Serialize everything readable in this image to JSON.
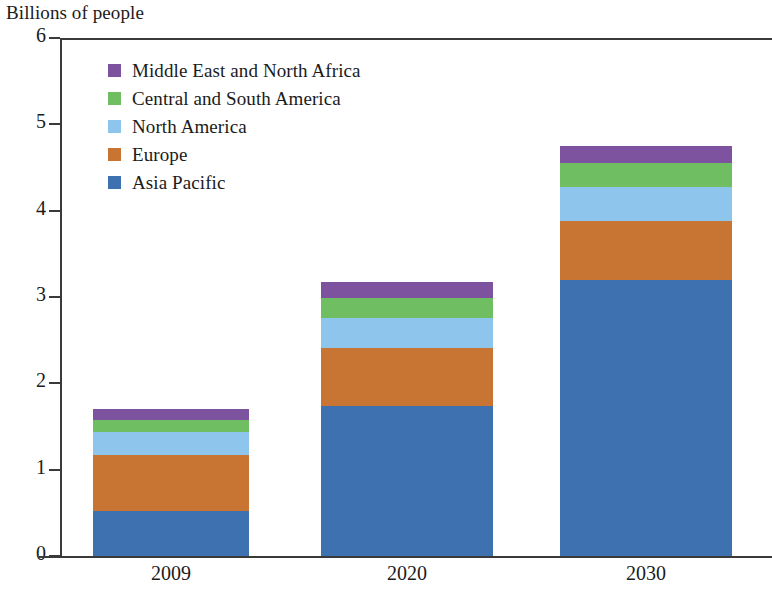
{
  "chart_data": {
    "type": "bar",
    "stacked": true,
    "title": "",
    "ylabel": "Billions of people",
    "xlabel": "",
    "categories": [
      "2009",
      "2020",
      "2030"
    ],
    "ylim": [
      0,
      6
    ],
    "yticks": [
      "0",
      "1",
      "2",
      "3",
      "4",
      "5",
      "6"
    ],
    "grid": false,
    "legend_position": "inside-upper-left",
    "series": [
      {
        "name": "Middle East and North Africa",
        "color": "#7D529E",
        "values": [
          0.12,
          0.18,
          0.2
        ]
      },
      {
        "name": "Central and South America",
        "color": "#6FBE61",
        "values": [
          0.14,
          0.23,
          0.27
        ]
      },
      {
        "name": "North America",
        "color": "#8EC5EC",
        "values": [
          0.27,
          0.35,
          0.4
        ]
      },
      {
        "name": "Europe",
        "color": "#C87533",
        "values": [
          0.65,
          0.67,
          0.68
        ]
      },
      {
        "name": "Asia Pacific",
        "color": "#3E71B0",
        "values": [
          0.52,
          1.74,
          3.2
        ]
      }
    ],
    "totals": [
      1.82,
      3.17,
      4.75
    ]
  },
  "axis": {
    "y_title": "Billions of people"
  },
  "legend": {
    "items": [
      {
        "label": "Middle East and North Africa",
        "color": "#7D529E"
      },
      {
        "label": "Central and South America",
        "color": "#6FBE61"
      },
      {
        "label": "North America",
        "color": "#8EC5EC"
      },
      {
        "label": "Europe",
        "color": "#C87533"
      },
      {
        "label": "Asia Pacific",
        "color": "#3E71B0"
      }
    ]
  },
  "colors": {
    "axis": "#3a3a3a",
    "background": "#ffffff",
    "text": "#1b1b1b"
  }
}
